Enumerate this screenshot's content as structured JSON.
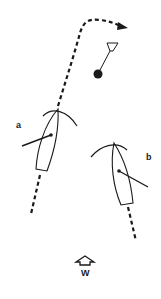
{
  "diagram": {
    "type": "sailing-rules",
    "labels": {
      "boat_a": "a",
      "boat_b": "b",
      "wind": "W"
    },
    "elements": {
      "mark": "mark-buoy-with-flag",
      "boat_a_course": "dashed-course-line-rounding-mark",
      "boat_b_course": "dashed-course-line",
      "wind_indicator": "wind-arrow-up"
    },
    "colors": {
      "ink": "#1a1a1a",
      "background": "#ffffff"
    }
  }
}
